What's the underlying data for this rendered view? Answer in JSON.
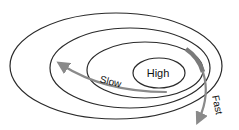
{
  "diagram": {
    "rings": [
      {
        "name": "outer-ring",
        "cx": 116,
        "cy": 66,
        "rx": 106,
        "ry": 53
      },
      {
        "name": "second-ring",
        "cx": 130,
        "cy": 68,
        "rx": 80,
        "ry": 40
      },
      {
        "name": "third-ring",
        "cx": 145,
        "cy": 70,
        "rx": 58,
        "ry": 28
      },
      {
        "name": "inner-ring",
        "cx": 159,
        "cy": 73,
        "rx": 26,
        "ry": 15
      }
    ],
    "labels": {
      "center": "High",
      "slow": "Slow",
      "fast": "Fast"
    },
    "colors": {
      "ring_stroke": "#2a2a2a",
      "arrow": "#8a8a8a"
    }
  }
}
